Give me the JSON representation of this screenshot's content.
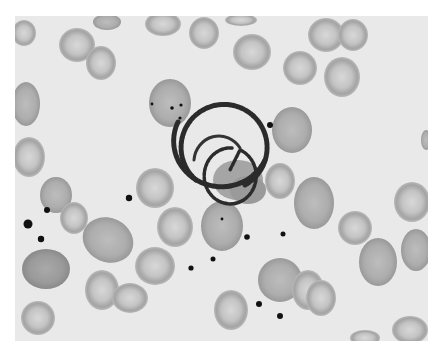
{
  "image": {
    "description": "Grayscale light micrograph of a blood smear showing a coiled spirochete-like organism encircling a cell, surrounded by red blood cells and small dark granules",
    "colors": {
      "page": "#ffffff",
      "background": "#e9e9e9",
      "cell_light": "#c9c9c9",
      "cell_mid": "#b0b0b0",
      "cell_dark": "#8f8f8f",
      "coil": "#2a2a2a",
      "granule": "#111111"
    },
    "frame": {
      "x": 15,
      "y": 16,
      "width": 413,
      "height": 325
    }
  }
}
